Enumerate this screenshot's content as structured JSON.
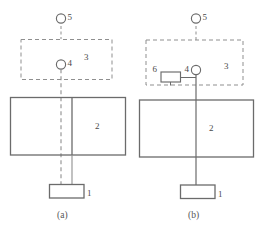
{
  "figure": {
    "type": "engineering-schematic",
    "colors": {
      "solid_stroke": "#6b6b6b",
      "dashed_stroke": "#8f8f8f",
      "label_text": "#4a4a4a",
      "caption_text": "#555555",
      "background": "#ffffff"
    },
    "panels": [
      {
        "id": "a",
        "caption": "(a)",
        "parts": {
          "part1": {
            "label": "1",
            "shape": "rectangle",
            "name": "lower-box"
          },
          "part2": {
            "label": "2",
            "shape": "rectangle",
            "name": "main-body"
          },
          "part3": {
            "label": "3",
            "shape": "dashed-rectangle",
            "name": "enclosure"
          },
          "part4": {
            "label": "4",
            "shape": "circle",
            "name": "inner-node"
          },
          "part5": {
            "label": "5",
            "shape": "circle",
            "name": "upper-node"
          }
        },
        "connector_style": "dashed"
      },
      {
        "id": "b",
        "caption": "(b)",
        "parts": {
          "part1": {
            "label": "1",
            "shape": "rectangle",
            "name": "lower-box"
          },
          "part2": {
            "label": "2",
            "shape": "rectangle",
            "name": "main-body"
          },
          "part3": {
            "label": "3",
            "shape": "dashed-rectangle",
            "name": "enclosure"
          },
          "part4": {
            "label": "4",
            "shape": "circle",
            "name": "inner-node"
          },
          "part5": {
            "label": "5",
            "shape": "circle",
            "name": "upper-node"
          },
          "part6": {
            "label": "6",
            "shape": "small-rectangle",
            "name": "side-module"
          }
        },
        "connector_style": "solid"
      }
    ]
  }
}
